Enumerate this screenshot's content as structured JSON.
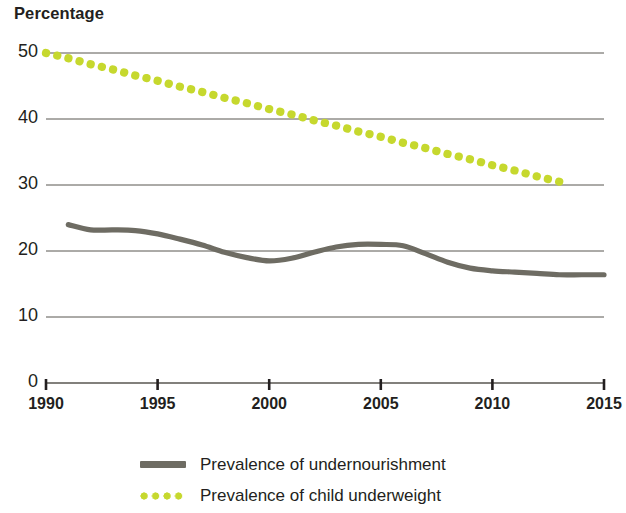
{
  "chart_data": {
    "type": "line",
    "title": "",
    "ylabel": "Percentage",
    "xlabel": "",
    "xlim": [
      1990,
      2015
    ],
    "ylim": [
      0,
      50
    ],
    "grid": true,
    "legend_position": "bottom",
    "y_ticks": [
      50,
      40,
      30,
      20,
      10,
      0
    ],
    "x_ticks": [
      1990,
      1995,
      2000,
      2005,
      2010,
      2015
    ],
    "series": [
      {
        "name": "Prevalence of undernourishment",
        "style": "solid",
        "color": "#6e6c63",
        "x": [
          1991,
          1992,
          1993,
          1994,
          1995,
          1996,
          1997,
          1998,
          1999,
          2000,
          2001,
          2002,
          2003,
          2004,
          2005,
          2006,
          2007,
          2008,
          2009,
          2010,
          2011,
          2012,
          2013,
          2014,
          2015
        ],
        "values": [
          24.0,
          23.2,
          23.2,
          23.1,
          22.6,
          21.8,
          20.9,
          19.8,
          19.0,
          18.5,
          18.9,
          19.8,
          20.6,
          21.0,
          21.0,
          20.8,
          19.6,
          18.3,
          17.4,
          17.0,
          16.8,
          16.6,
          16.4,
          16.4,
          16.4
        ]
      },
      {
        "name": "Prevalence of child underweight",
        "style": "dotted",
        "color": "#c6d82e",
        "x": [
          1990,
          1991,
          1992,
          1993,
          1994,
          1995,
          1996,
          1997,
          1998,
          1999,
          2000,
          2001,
          2002,
          2003,
          2004,
          2005,
          2006,
          2007,
          2008,
          2009,
          2010,
          2011,
          2012,
          2013
        ],
        "values": [
          50.0,
          49.2,
          48.3,
          47.5,
          46.6,
          45.8,
          44.9,
          44.1,
          43.2,
          42.4,
          41.5,
          40.7,
          39.8,
          39.0,
          38.1,
          37.3,
          36.4,
          35.6,
          34.7,
          33.9,
          33.0,
          32.2,
          31.3,
          30.5
        ]
      }
    ]
  },
  "axis": {
    "y_title": "Percentage",
    "y_tick_labels": [
      "50",
      "40",
      "30",
      "20",
      "10",
      "0"
    ],
    "x_tick_labels": [
      "1990",
      "1995",
      "2000",
      "2005",
      "2010",
      "2015"
    ]
  },
  "legend": {
    "items": [
      {
        "label": "Prevalence of undernourishment",
        "marker": "solid-line-swatch",
        "color": "#6e6c63"
      },
      {
        "label": "Prevalence of child underweight",
        "marker": "dotted-line-swatch",
        "color": "#c6d82e"
      }
    ]
  }
}
